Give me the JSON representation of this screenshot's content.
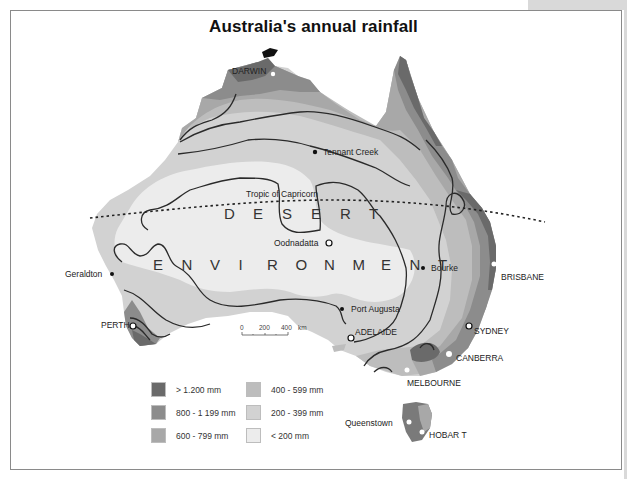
{
  "title": "Australia's annual rainfall",
  "colors": {
    "over_1200": "#6a6a6a",
    "r800_1199": "#8c8c8c",
    "r600_799": "#a8a8a8",
    "r400_599": "#bdbdbd",
    "r200_399": "#d2d2d2",
    "under_200": "#ececec",
    "contour": "#2a2a2a",
    "frame": "#8a8a8a"
  },
  "cities": {
    "darwin": "DARWIN",
    "tennant_creek": "Tennant Creek",
    "tropic": "Tropic of Capricorn",
    "oodnadatta": "Oodnadatta",
    "geraldton": "Geraldton",
    "bourke": "Bourke",
    "brisbane": "BRISBANE",
    "perth": "PERTH",
    "port_augusta": "Port Augusta",
    "adelaide": "ADELAIDE",
    "sydney": "SYDNEY",
    "canberra": "CANBERRA",
    "melbourne": "MELBOURNE",
    "queenstown": "Queenstown",
    "hobart": "HOBAR T"
  },
  "desert_text": {
    "line1": [
      "D",
      "E",
      "S",
      "E",
      "R",
      "T"
    ],
    "line2": [
      "E",
      "N",
      "V",
      "I",
      "R",
      "O",
      "N",
      "M",
      "E",
      "N",
      "T"
    ]
  },
  "scale": {
    "ticks": [
      "0",
      "200",
      "400"
    ],
    "unit": "km"
  },
  "legend": {
    "items": [
      {
        "label": "> 1.200 mm",
        "color": "#6a6a6a"
      },
      {
        "label": "800 - 1 199 mm",
        "color": "#8c8c8c"
      },
      {
        "label": "600 - 799 mm",
        "color": "#a8a8a8"
      },
      {
        "label": "400 - 599 mm",
        "color": "#bdbdbd"
      },
      {
        "label": "200 - 399 mm",
        "color": "#d2d2d2"
      },
      {
        "label": "< 200 mm",
        "color": "#ececec"
      }
    ]
  }
}
